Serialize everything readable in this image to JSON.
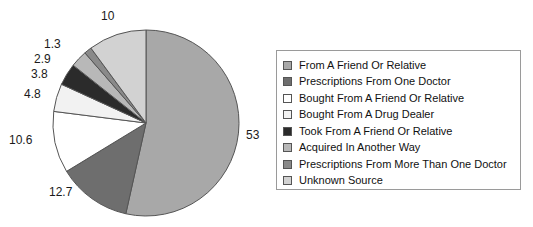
{
  "chart_data": {
    "type": "pie",
    "title": "",
    "legend_position": "right",
    "grid": false,
    "labels_shown_on_chart": true,
    "categories": [
      "From A Friend Or Relative",
      "Prescriptions From One Doctor",
      "Bought From A Friend Or Relative",
      "Bought From A Drug Dealer",
      "Took From A Friend Or Relative",
      "Acquired In Another Way",
      "Prescriptions From More Than One Doctor",
      "Unknown Source"
    ],
    "values": [
      53,
      12.7,
      10.6,
      4.8,
      3.8,
      2.9,
      1.3,
      10
    ],
    "value_labels": [
      "53",
      "12.7",
      "10.6",
      "4.8",
      "3.8",
      "2.9",
      "1.3",
      "10"
    ],
    "colors": [
      "#a8a8a8",
      "#6e6e6e",
      "#ffffff",
      "#f2f2f2",
      "#2b2b2b",
      "#b8b8b8",
      "#8a8a8a",
      "#d2d2d2"
    ],
    "slice_border_color": "#555555",
    "start_angle_deg": 0,
    "direction": "clockwise",
    "units": "percent"
  },
  "legend": {
    "border_color": "#9a9a9a",
    "items": [
      {
        "label": "From A Friend Or Relative",
        "color": "#a8a8a8"
      },
      {
        "label": "Prescriptions From One Doctor",
        "color": "#6e6e6e"
      },
      {
        "label": "Bought From A Friend Or Relative",
        "color": "#ffffff"
      },
      {
        "label": "Bought From A Drug Dealer",
        "color": "#f2f2f2"
      },
      {
        "label": "Took From A Friend Or Relative",
        "color": "#2b2b2b"
      },
      {
        "label": "Acquired In Another Way",
        "color": "#b8b8b8"
      },
      {
        "label": "Prescriptions From More Than One Doctor",
        "color": "#8a8a8a"
      },
      {
        "label": "Unknown Source",
        "color": "#d2d2d2"
      }
    ]
  },
  "pie_labels": [
    {
      "text": "10",
      "x": 101,
      "y": 10
    },
    {
      "text": "1.3",
      "x": 44,
      "y": 38
    },
    {
      "text": "2.9",
      "x": 34,
      "y": 53
    },
    {
      "text": "3.8",
      "x": 31,
      "y": 68
    },
    {
      "text": "4.8",
      "x": 24,
      "y": 88
    },
    {
      "text": "10.6",
      "x": 9,
      "y": 134
    },
    {
      "text": "12.7",
      "x": 49,
      "y": 186
    },
    {
      "text": "53",
      "x": 246,
      "y": 129
    }
  ],
  "geometry": {
    "center_x": 146,
    "center_y": 123,
    "radius": 93
  }
}
